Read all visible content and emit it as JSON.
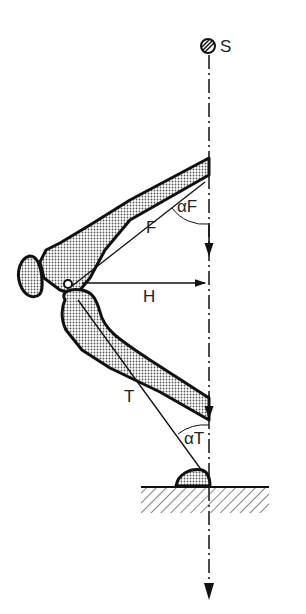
{
  "diagram": {
    "labels": {
      "s": "S",
      "alpha_f": "αF",
      "f": "F",
      "h": "H",
      "t": "T",
      "alpha_t": "αT"
    },
    "elements": [
      "hip-point-S",
      "femur",
      "patella",
      "tibia",
      "foot",
      "ground",
      "vertical-load-line",
      "force-vectors"
    ],
    "colors": {
      "line": "#1a1a1a",
      "fill": "#bdbdbd",
      "background": "#ffffff"
    }
  }
}
